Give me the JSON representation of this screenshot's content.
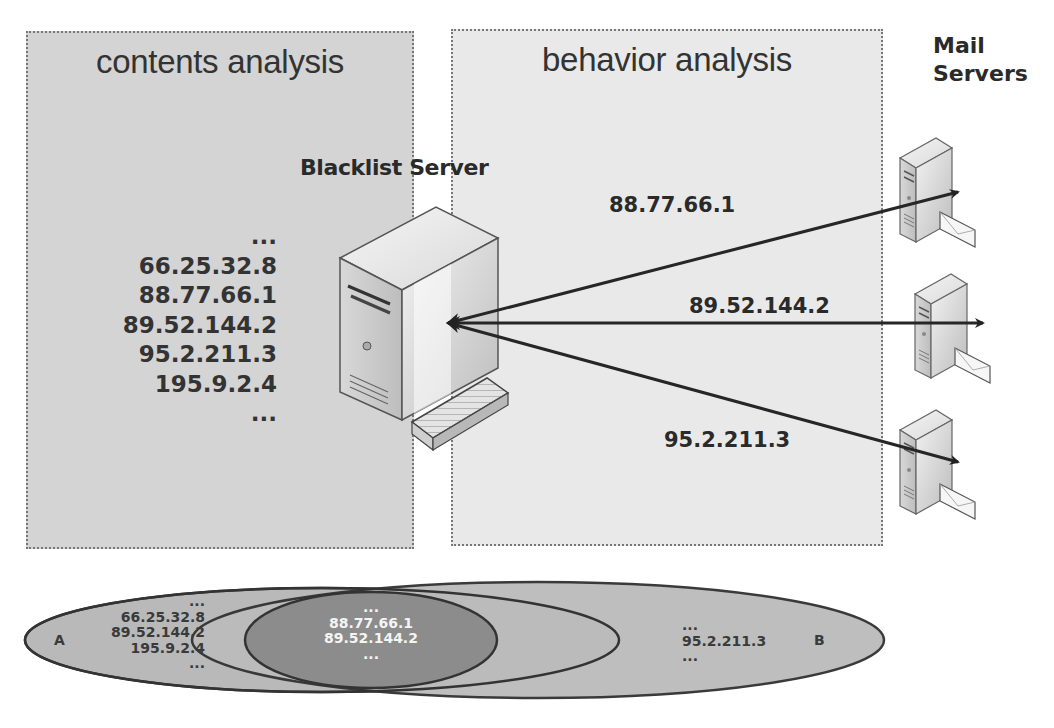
{
  "regions": {
    "contents": {
      "title": "contents analysis",
      "fill": "#d4d4d4"
    },
    "behavior": {
      "title": "behavior analysis",
      "fill": "#e9e9e9"
    }
  },
  "blacklist_server": {
    "label": "Blacklist Server",
    "ip_list": [
      "...",
      "66.25.32.8",
      "88.77.66.1",
      "89.52.144.2",
      "95.2.211.3",
      "195.9.2.4",
      "..."
    ]
  },
  "mail_servers": {
    "label_line1": "Mail",
    "label_line2": "Servers",
    "count": 3
  },
  "connections": [
    {
      "label": "88.77.66.1",
      "target": "mail-server-1"
    },
    {
      "label": "89.52.144.2",
      "target": "mail-server-2"
    },
    {
      "label": "95.2.211.3",
      "target": "mail-server-3"
    }
  ],
  "venn": {
    "set_a": {
      "label": "A",
      "items": [
        "...",
        "66.25.32.8",
        "89.52.144.2",
        "195.9.2.4",
        "..."
      ]
    },
    "intersection": {
      "items": [
        "...",
        "88.77.66.1",
        "89.52.144.2",
        "..."
      ]
    },
    "set_b": {
      "label": "B",
      "items": [
        "...",
        "95.2.211.3",
        "..."
      ]
    },
    "colors": {
      "outer": "#b8b8b8",
      "inner": "#8a8a8a",
      "stroke": "#333333"
    }
  }
}
